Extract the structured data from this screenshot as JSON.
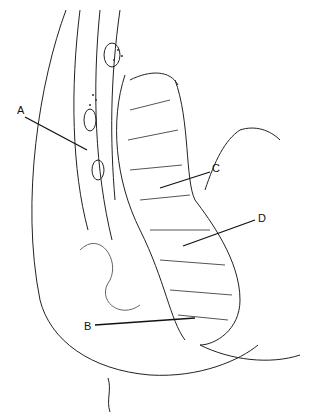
{
  "figure": {
    "labels": [
      {
        "id": "A",
        "text": "A",
        "x": 17,
        "y": 110
      },
      {
        "id": "B",
        "text": "B",
        "x": 85,
        "y": 320
      },
      {
        "id": "C",
        "text": "C",
        "x": 212,
        "y": 168
      },
      {
        "id": "D",
        "text": "D",
        "x": 258,
        "y": 214
      }
    ]
  }
}
